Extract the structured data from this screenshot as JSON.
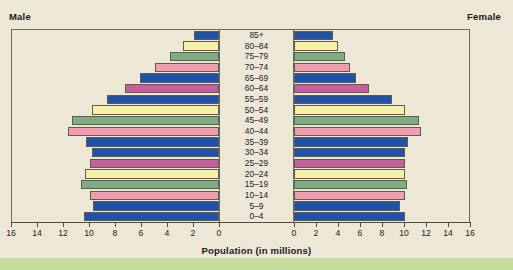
{
  "labels": {
    "male": "Male",
    "female": "Female",
    "axis_title": "Population (in millions)"
  },
  "chart_data": {
    "type": "bar",
    "subtype": "population-pyramid",
    "title": "",
    "xlabel": "Population (in millions)",
    "ylabel": "",
    "grid": false,
    "legend": "none",
    "orientation": "horizontal",
    "xlim_left": [
      16,
      0
    ],
    "xlim_right": [
      0,
      16
    ],
    "xticks_left": [
      "16",
      "14",
      "12",
      "10",
      "8",
      "6",
      "4",
      "2",
      "0"
    ],
    "xticks_right": [
      "0",
      "2",
      "4",
      "6",
      "8",
      "10",
      "12",
      "14",
      "16"
    ],
    "xtick_values": [
      16,
      14,
      12,
      10,
      8,
      6,
      4,
      2,
      0
    ],
    "categories": [
      "85+",
      "80–84",
      "75–79",
      "70–74",
      "65–69",
      "60–64",
      "55–59",
      "50–54",
      "45–49",
      "40–44",
      "35–39",
      "30–34",
      "25–29",
      "20–24",
      "15–19",
      "10–14",
      "5–9",
      "0–4"
    ],
    "series": [
      {
        "name": "Male",
        "side": "left",
        "values": [
          1.9,
          2.8,
          3.8,
          4.9,
          6.1,
          7.2,
          8.6,
          9.8,
          11.3,
          11.6,
          10.2,
          9.8,
          9.9,
          10.3,
          10.6,
          9.9,
          9.7,
          10.4
        ]
      },
      {
        "name": "Female",
        "side": "right",
        "values": [
          3.5,
          4.0,
          4.6,
          5.1,
          5.6,
          6.8,
          8.9,
          10.1,
          11.4,
          11.5,
          10.4,
          10.1,
          10.1,
          10.1,
          10.3,
          10.1,
          9.6,
          10.1
        ]
      }
    ],
    "bar_colors": [
      "#1f52a8",
      "#f6f0a8",
      "#7fad82",
      "#f29cb0",
      "#1f52a8",
      "#c25f9c",
      "#1f52a8",
      "#f6f0a8",
      "#7fad82",
      "#f29cb0",
      "#1f52a8",
      "#1f52a8",
      "#c25f9c",
      "#f6f0a8",
      "#7fad82",
      "#f29cb0",
      "#1f52a8",
      "#1f52a8"
    ]
  },
  "colors": {
    "background": "#ece8d5",
    "frame": "#6b6a5e",
    "bar_outline": "#5d5b52",
    "text": "#1a1a1a",
    "bottom_strip": "#c6dc9a",
    "blue": "#1f52a8",
    "yellow": "#f6f0a8",
    "green": "#7fad82",
    "pink": "#f29cb0",
    "magenta": "#c25f9c"
  }
}
